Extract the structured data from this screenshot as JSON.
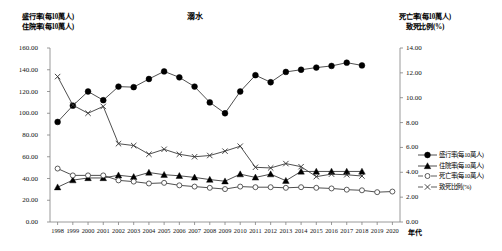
{
  "chart_title": "溺水",
  "left_axis_title_line1": "盛行率(每10萬人)",
  "left_axis_title_line2": "住院率(每10萬人)",
  "right_axis_title_line1": "死亡率(每10萬人)",
  "right_axis_title_line2": "致死比例(%)",
  "xaxis_name": "年代",
  "left_ticks": [
    "0.00",
    "20.00",
    "40.00",
    "60.00",
    "80.00",
    "100.00",
    "120.00",
    "140.00",
    "160.00"
  ],
  "right_ticks": [
    "0.00",
    "2.00",
    "4.00",
    "6.00",
    "8.00",
    "10.00",
    "12.00",
    "14.00"
  ],
  "legend": [
    {
      "label": "盛行率(每10萬人)",
      "marker": "filled-circle",
      "axis": "left"
    },
    {
      "label": "住院率(每10萬人)",
      "marker": "filled-triangle",
      "axis": "left"
    },
    {
      "label": "死亡率(每10萬人)",
      "marker": "open-circle",
      "axis": "right"
    },
    {
      "label": "致死比例(%)",
      "marker": "cross",
      "axis": "right"
    }
  ],
  "chart_data": {
    "type": "line",
    "title": "溺水",
    "xlabel": "年代",
    "ylabel": "盛行率(每10萬人) / 住院率(每10萬人)",
    "y2label": "死亡率(每10萬人) / 致死比例(%)",
    "ylim": [
      0,
      160
    ],
    "y2lim": [
      0,
      14
    ],
    "grid": false,
    "legend_position": "right",
    "categories": [
      "1998",
      "1999",
      "2000",
      "2001",
      "2002",
      "2003",
      "2004",
      "2005",
      "2006",
      "2007",
      "2008",
      "2009",
      "2010",
      "2011",
      "2012",
      "2013",
      "2014",
      "2015",
      "2016",
      "2017",
      "2018",
      "2019",
      "2020"
    ],
    "series": [
      {
        "name": "盛行率(每10萬人)",
        "marker": "filled-circle",
        "axis": "left",
        "values": [
          92.0,
          107.0,
          120.0,
          112.0,
          124.5,
          124.0,
          131.5,
          138.5,
          133.0,
          124.5,
          110.0,
          100.0,
          120.0,
          135.0,
          128.5,
          138.0,
          140.0,
          142.0,
          143.5,
          146.5,
          144.0,
          null,
          null
        ]
      },
      {
        "name": "住院率(每10萬人)",
        "marker": "filled-triangle",
        "axis": "left",
        "values": [
          32.0,
          38.5,
          40.5,
          40.5,
          43.0,
          41.5,
          45.5,
          43.5,
          42.5,
          41.0,
          39.0,
          37.5,
          44.0,
          41.0,
          44.0,
          38.0,
          46.5,
          46.5,
          46.5,
          46.5,
          46.5,
          null,
          null
        ]
      },
      {
        "name": "死亡率(每10萬人)",
        "marker": "open-circle",
        "axis": "right",
        "values": [
          4.3,
          3.75,
          3.75,
          3.75,
          3.35,
          3.25,
          3.1,
          3.15,
          2.95,
          2.85,
          2.75,
          2.65,
          2.85,
          2.8,
          2.8,
          2.75,
          2.8,
          2.75,
          2.7,
          2.6,
          2.55,
          2.4,
          2.45
        ]
      },
      {
        "name": "致死比例(%)",
        "marker": "cross",
        "axis": "right",
        "values": [
          11.7,
          9.4,
          8.75,
          9.3,
          6.3,
          6.15,
          5.45,
          5.85,
          5.45,
          5.25,
          5.35,
          5.7,
          6.1,
          4.4,
          4.35,
          4.7,
          4.45,
          3.65,
          3.85,
          3.8,
          3.7,
          null,
          null
        ]
      }
    ]
  }
}
